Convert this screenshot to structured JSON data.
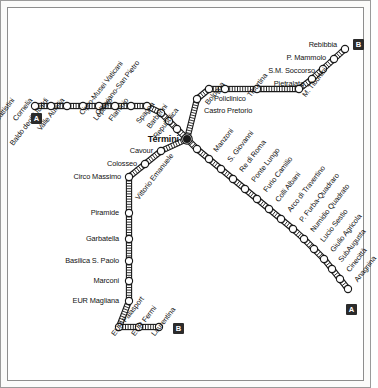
{
  "map": {
    "title": "Rome Metro Map",
    "background": "#ffffff",
    "line_color": "#1a1a1a",
    "station_fill": "#ffffff",
    "interchange_fill": "#1a1a1a"
  },
  "badges": [
    {
      "id": "badge-line-a-west",
      "label": "A",
      "x": 30,
      "y": 112
    },
    {
      "id": "badge-line-b-northeast",
      "label": "B",
      "x": 352,
      "y": 38
    },
    {
      "id": "badge-line-b-south",
      "label": "B",
      "x": 172,
      "y": 322
    },
    {
      "id": "badge-line-a-southeast",
      "label": "A",
      "x": 345,
      "y": 303
    }
  ],
  "lines": [
    {
      "id": "line-a",
      "name": "Line A",
      "badge": "A",
      "stations": [
        {
          "name": "Battistini",
          "x": 34,
          "y": 105,
          "label_x": 12,
          "label_y": 98,
          "rot": -52,
          "anchor": "end"
        },
        {
          "name": "Cornelia",
          "x": 50,
          "y": 105,
          "label_x": 30,
          "label_y": 98,
          "rot": -52,
          "anchor": "end"
        },
        {
          "name": "Baldo degli Ubaldi",
          "x": 66,
          "y": 105,
          "label_x": 46,
          "label_y": 98,
          "rot": -52,
          "anchor": "end"
        },
        {
          "name": "Valle Aurelia",
          "x": 82,
          "y": 105,
          "label_x": 62,
          "label_y": 98,
          "rot": -52,
          "anchor": "end"
        },
        {
          "name": "Cipro-Musei Vaticani",
          "x": 98,
          "y": 105,
          "label_x": 80,
          "label_y": 113,
          "rot": -52,
          "anchor": "start"
        },
        {
          "name": "Ottaviano-San Pietro",
          "x": 114,
          "y": 105,
          "label_x": 96,
          "label_y": 113,
          "rot": -52,
          "anchor": "start"
        },
        {
          "name": "Lepanto",
          "x": 130,
          "y": 105,
          "label_x": 110,
          "label_y": 98,
          "rot": -52,
          "anchor": "end"
        },
        {
          "name": "Flaminio",
          "x": 146,
          "y": 105,
          "label_x": 126,
          "label_y": 98,
          "rot": -52,
          "anchor": "end"
        },
        {
          "name": "Spagna",
          "x": 160,
          "y": 112,
          "label_x": 152,
          "label_y": 102,
          "rot": -52,
          "anchor": "end"
        },
        {
          "name": "Barberini",
          "x": 168,
          "y": 120,
          "label_x": 165,
          "label_y": 104,
          "rot": -52,
          "anchor": "end"
        },
        {
          "name": "Repubblica",
          "x": 176,
          "y": 128,
          "label_x": 176,
          "label_y": 108,
          "rot": -52,
          "anchor": "end"
        },
        {
          "name": "Termini",
          "x": 186,
          "y": 138,
          "label_x": 178,
          "label_y": 138,
          "rot": 0,
          "anchor": "end",
          "interchange": true
        },
        {
          "name": "Vittorio Emanuele",
          "x": 196,
          "y": 148,
          "label_x": 136,
          "label_y": 198,
          "rot": -52,
          "anchor": "start"
        },
        {
          "name": "Manzoni",
          "x": 208,
          "y": 158,
          "label_x": 214,
          "label_y": 150,
          "rot": -52,
          "anchor": "start"
        },
        {
          "name": "S. Giovanni",
          "x": 220,
          "y": 168,
          "label_x": 228,
          "label_y": 160,
          "rot": -52,
          "anchor": "start"
        },
        {
          "name": "Re di Roma",
          "x": 232,
          "y": 178,
          "label_x": 240,
          "label_y": 170,
          "rot": -52,
          "anchor": "start"
        },
        {
          "name": "Ponte Lungo",
          "x": 244,
          "y": 188,
          "label_x": 252,
          "label_y": 180,
          "rot": -52,
          "anchor": "start"
        },
        {
          "name": "Furio Camilio",
          "x": 256,
          "y": 198,
          "label_x": 264,
          "label_y": 190,
          "rot": -52,
          "anchor": "start"
        },
        {
          "name": "Colli Albani",
          "x": 268,
          "y": 208,
          "label_x": 276,
          "label_y": 200,
          "rot": -52,
          "anchor": "start"
        },
        {
          "name": "Arco di Travertino",
          "x": 280,
          "y": 218,
          "label_x": 288,
          "label_y": 210,
          "rot": -52,
          "anchor": "start"
        },
        {
          "name": "P. Furba-Quadraro",
          "x": 292,
          "y": 228,
          "label_x": 300,
          "label_y": 220,
          "rot": -52,
          "anchor": "start"
        },
        {
          "name": "Numidio Quadrato",
          "x": 303,
          "y": 238,
          "label_x": 311,
          "label_y": 230,
          "rot": -52,
          "anchor": "start"
        },
        {
          "name": "Lucio Sestio",
          "x": 313,
          "y": 248,
          "label_x": 321,
          "label_y": 240,
          "rot": -52,
          "anchor": "start"
        },
        {
          "name": "Giulio Agricola",
          "x": 323,
          "y": 258,
          "label_x": 331,
          "label_y": 250,
          "rot": -52,
          "anchor": "start"
        },
        {
          "name": "SubAugusta",
          "x": 331,
          "y": 268,
          "label_x": 339,
          "label_y": 260,
          "rot": -52,
          "anchor": "start"
        },
        {
          "name": "Cinecittà",
          "x": 339,
          "y": 278,
          "label_x": 347,
          "label_y": 270,
          "rot": -52,
          "anchor": "start"
        },
        {
          "name": "Anagnina",
          "x": 347,
          "y": 288,
          "label_x": 355,
          "label_y": 280,
          "rot": -52,
          "anchor": "start"
        }
      ]
    },
    {
      "id": "line-b",
      "name": "Line B",
      "badge": "B",
      "stations": [
        {
          "name": "Rebibbia",
          "x": 344,
          "y": 48,
          "label_x": 336,
          "label_y": 44,
          "rot": 0,
          "anchor": "end"
        },
        {
          "name": "P. Mammolo",
          "x": 333,
          "y": 58,
          "label_x": 325,
          "label_y": 57,
          "rot": 0,
          "anchor": "end"
        },
        {
          "name": "S.M. Soccorso",
          "x": 322,
          "y": 68,
          "label_x": 314,
          "label_y": 70,
          "rot": 0,
          "anchor": "end"
        },
        {
          "name": "Pietralata",
          "x": 311,
          "y": 78,
          "label_x": 303,
          "label_y": 83,
          "rot": 0,
          "anchor": "end"
        },
        {
          "name": "M. Tiburtini",
          "x": 298,
          "y": 88,
          "label_x": 303,
          "label_y": 95,
          "rot": -52,
          "anchor": "start"
        },
        {
          "name": "Tiburtina",
          "x": 256,
          "y": 88,
          "label_x": 248,
          "label_y": 95,
          "rot": -52,
          "anchor": "start"
        },
        {
          "name": "Bologna",
          "x": 224,
          "y": 88,
          "label_x": 222,
          "label_y": 82,
          "rot": -52,
          "anchor": "end"
        },
        {
          "name": "Policlinico",
          "x": 208,
          "y": 88,
          "label_x": 213,
          "label_y": 98,
          "rot": 0,
          "anchor": "start"
        },
        {
          "name": "Castro Pretorio",
          "x": 196,
          "y": 98,
          "label_x": 203,
          "label_y": 110,
          "rot": 0,
          "anchor": "start"
        },
        {
          "name": "Termini",
          "x": 186,
          "y": 138,
          "label_x": 178,
          "label_y": 138,
          "rot": 0,
          "anchor": "end",
          "interchange": true
        },
        {
          "name": "Cavour",
          "x": 160,
          "y": 150,
          "label_x": 152,
          "label_y": 150,
          "rot": 0,
          "anchor": "end"
        },
        {
          "name": "Colosseo",
          "x": 144,
          "y": 163,
          "label_x": 136,
          "label_y": 163,
          "rot": 0,
          "anchor": "end"
        },
        {
          "name": "Circo Massimo",
          "x": 128,
          "y": 176,
          "label_x": 120,
          "label_y": 176,
          "rot": 0,
          "anchor": "end"
        },
        {
          "name": "Piramide",
          "x": 128,
          "y": 212,
          "label_x": 118,
          "label_y": 212,
          "rot": 0,
          "anchor": "end"
        },
        {
          "name": "Garbatella",
          "x": 128,
          "y": 238,
          "label_x": 118,
          "label_y": 238,
          "rot": 0,
          "anchor": "end"
        },
        {
          "name": "Basilica S. Paolo",
          "x": 128,
          "y": 260,
          "label_x": 118,
          "label_y": 260,
          "rot": 0,
          "anchor": "end"
        },
        {
          "name": "Marconi",
          "x": 128,
          "y": 280,
          "label_x": 118,
          "label_y": 280,
          "rot": 0,
          "anchor": "end"
        },
        {
          "name": "EUR Magliana",
          "x": 128,
          "y": 300,
          "label_x": 118,
          "label_y": 300,
          "rot": 0,
          "anchor": "end"
        },
        {
          "name": "EUR Palasport",
          "x": 118,
          "y": 326,
          "label_x": 112,
          "label_y": 334,
          "rot": -52,
          "anchor": "start"
        },
        {
          "name": "EUR Fermi",
          "x": 138,
          "y": 326,
          "label_x": 132,
          "label_y": 334,
          "rot": -52,
          "anchor": "start"
        },
        {
          "name": "Laurentina",
          "x": 158,
          "y": 326,
          "label_x": 152,
          "label_y": 334,
          "rot": -52,
          "anchor": "start"
        }
      ]
    }
  ]
}
